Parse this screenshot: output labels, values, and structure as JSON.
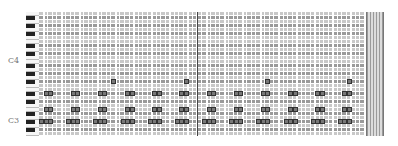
{
  "piano_roll": {
    "octave_labels": [
      {
        "text": "C4",
        "y": 61
      },
      {
        "text": "C3",
        "y": 121
      }
    ],
    "grid": {
      "columns": 72,
      "rows": 31,
      "beats_per_bar": 4,
      "playhead_column": 34
    },
    "colors": {
      "row_dark": "#9a9a9a",
      "row_light": "#c8c8c8",
      "note_border": "#333333",
      "note_fill": "#777777",
      "playhead": "#444444"
    },
    "notes": [
      {
        "pitch": "G4",
        "row": 17,
        "cols": [
          16,
          32,
          50,
          68
        ]
      },
      {
        "pitch": "E3",
        "row": 20,
        "cols": [
          1,
          2,
          7,
          8,
          13,
          14,
          19,
          20,
          25,
          26,
          31,
          32,
          37,
          38,
          43,
          44,
          49,
          50,
          55,
          56,
          61,
          62,
          67,
          68
        ]
      },
      {
        "pitch": "C3",
        "row": 24,
        "cols": [
          1,
          2,
          7,
          8,
          13,
          14,
          19,
          20,
          25,
          26,
          31,
          32,
          37,
          38,
          43,
          44,
          49,
          50,
          55,
          56,
          61,
          62,
          67,
          68
        ]
      },
      {
        "pitch": "A2",
        "row": 27,
        "cols": [
          0,
          1,
          2,
          6,
          7,
          8,
          12,
          13,
          14,
          18,
          19,
          20,
          24,
          25,
          26,
          30,
          31,
          32,
          36,
          37,
          38,
          42,
          43,
          44,
          48,
          49,
          50,
          54,
          55,
          56,
          60,
          61,
          62,
          66,
          67,
          68
        ]
      }
    ]
  }
}
